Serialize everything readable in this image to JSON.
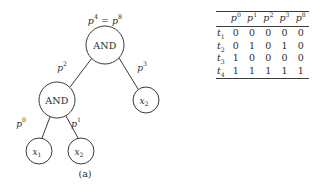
{
  "figure": {
    "panels": [
      {
        "id": "a",
        "caption": "(a)"
      },
      {
        "id": "b",
        "caption": "(b)"
      }
    ]
  },
  "tree": {
    "root_label": {
      "base_left": "p",
      "sup_left": "4",
      "relation": "=",
      "base_right": "p",
      "sup_right": "8"
    },
    "nodes": [
      {
        "id": "root",
        "label": "AND",
        "type": "gate",
        "cx": 105,
        "cy": 45,
        "r": 19
      },
      {
        "id": "inner",
        "label": "AND",
        "type": "gate",
        "cx": 57,
        "cy": 100,
        "r": 18
      },
      {
        "id": "leaf-x1",
        "label": "x",
        "sub": "1",
        "type": "var",
        "cx": 39,
        "cy": 151,
        "r": 13
      },
      {
        "id": "leaf-x2a",
        "label": "x",
        "sub": "2",
        "type": "var",
        "cx": 81,
        "cy": 151,
        "r": 13
      },
      {
        "id": "leaf-x2b",
        "label": "x",
        "sub": "2",
        "type": "var",
        "cx": 146,
        "cy": 100,
        "r": 13
      }
    ],
    "edges": [
      {
        "id": "edge-root-inner",
        "from": "root",
        "to": "inner",
        "label_base": "p",
        "label_sup": "2",
        "label_x": 62,
        "label_y": 68
      },
      {
        "id": "edge-root-x2b",
        "from": "root",
        "to": "leaf-x2b",
        "label_base": "p",
        "label_sup": "3",
        "label_x": 142,
        "label_y": 68
      },
      {
        "id": "edge-inner-x1",
        "from": "inner",
        "to": "leaf-x1",
        "label_base": "p",
        "label_sup": "0",
        "label_x": 21,
        "label_y": 124
      },
      {
        "id": "edge-inner-x2a",
        "from": "inner",
        "to": "leaf-x2a",
        "label_base": "p",
        "label_sup": "1",
        "label_x": 76,
        "label_y": 124
      }
    ]
  },
  "table": {
    "corner_header": "",
    "columns": [
      {
        "base": "p",
        "sup": "0"
      },
      {
        "base": "p",
        "sup": "1"
      },
      {
        "base": "p",
        "sup": "2"
      },
      {
        "base": "p",
        "sup": "3"
      },
      {
        "base": "p",
        "sup": "8"
      }
    ],
    "rows": [
      {
        "label_base": "t",
        "label_sub": "1",
        "values": [
          "0",
          "0",
          "0",
          "0",
          "0"
        ]
      },
      {
        "label_base": "t",
        "label_sub": "2",
        "values": [
          "0",
          "1",
          "0",
          "1",
          "0"
        ]
      },
      {
        "label_base": "t",
        "label_sub": "3",
        "values": [
          "1",
          "0",
          "0",
          "0",
          "0"
        ]
      },
      {
        "label_base": "t",
        "label_sub": "4",
        "values": [
          "1",
          "1",
          "1",
          "1",
          "1"
        ]
      }
    ]
  },
  "colors": {
    "ink": "#2b2b2b",
    "stroke": "#3a3a3a",
    "background": "#ffffff"
  }
}
